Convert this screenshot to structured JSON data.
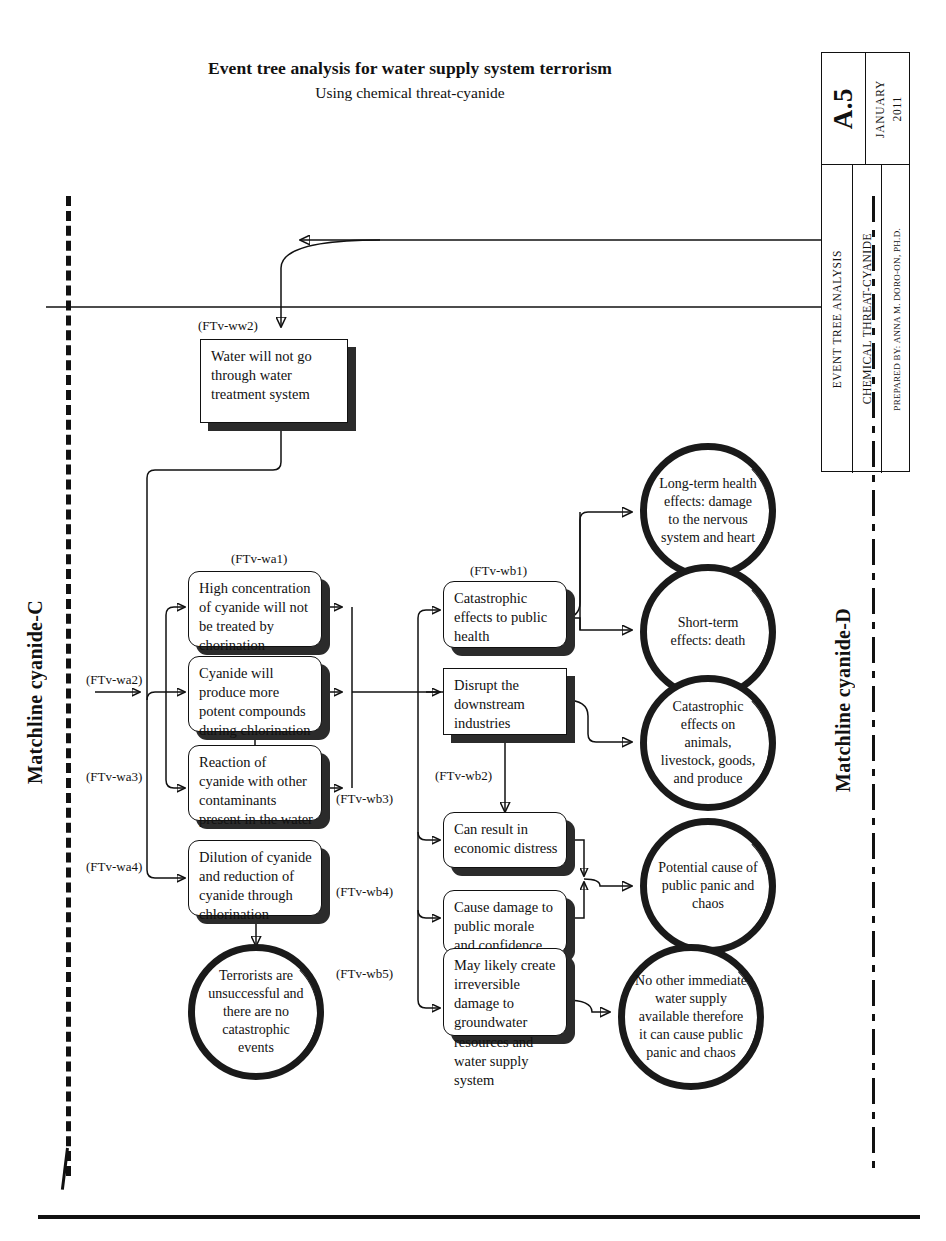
{
  "header": {
    "title": "Event tree analysis for water supply system terrorism",
    "subtitle": "Using chemical threat-cyanide"
  },
  "title_block": {
    "sheet_number": "A.5",
    "date_month": "JANUARY",
    "date_year": "2011",
    "line1": "EVENT TREE ANALYSIS",
    "line2": "CHEMICAL THREAT-CYANIDE",
    "line3": "PREPARED BY: ANNA M. DORO-ON, PH.D."
  },
  "matchlines": {
    "left_label": "Matchline cyanide-C",
    "right_label": "Matchline cyanide-D"
  },
  "nodes": {
    "ww2": "Water will not go through water treatment system",
    "wa1": "High concentration of cyanide will not be treated by chorination",
    "wa2": "Cyanide will produce more potent compounds during chlorination",
    "wa3": "Reaction of cyanide with other contaminants present in the water",
    "wa4": "Dilution of cyanide and reduction of cyanide through chlorination",
    "wb1": "Catastrophic effects to public health",
    "wb2": "Disrupt the downstream industries",
    "wb3": "Can result in economic distress",
    "wb4": "Cause damage to public morale and confidence",
    "wb5": "May likely create irreversible damage to groundwater resources and water supply system"
  },
  "outcomes": {
    "o1": "Long-term health effects: damage to the nervous system and heart",
    "o2": "Short-term effects: death",
    "o3": "Catastrophic effects on animals, livestock, goods, and produce",
    "o4": "Potential cause of public panic and chaos",
    "o5": "No other immediate water supply available therefore it can cause public panic and chaos",
    "terrorists": "Terrorists are unsuccessful and there are no catastrophic events"
  },
  "tags": {
    "ww2": "(FTv-ww2)",
    "wa1": "(FTv-wa1)",
    "wa2": "(FTv-wa2)",
    "wa3": "(FTv-wa3)",
    "wa4": "(FTv-wa4)",
    "wb1": "(FTv-wb1)",
    "wb2": "(FTv-wb2)",
    "wb3": "(FTv-wb3)",
    "wb4": "(FTv-wb4)",
    "wb5": "(FTv-wb5)"
  },
  "colors": {
    "ink": "#111111",
    "shadow": "#2b2b2b",
    "paper": "#ffffff"
  }
}
